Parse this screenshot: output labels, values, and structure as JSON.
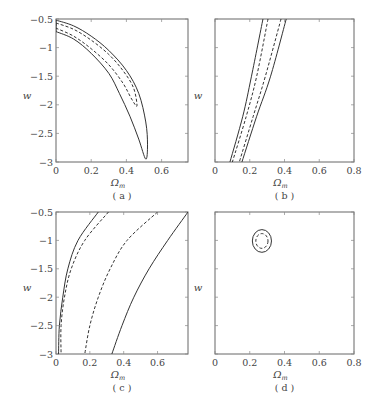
{
  "figure": {
    "panels": [
      {
        "id": "a",
        "caption": "( a )",
        "xlabel": "Ωm",
        "ylabel": "w",
        "xticks": [
          "0",
          "0.2",
          "0.4",
          "0.6"
        ],
        "yticks": [
          "-0.5",
          "-1",
          "-1.5",
          "-2",
          "-2.5",
          "-3"
        ],
        "show_yticks": true
      },
      {
        "id": "b",
        "caption": "( b )",
        "xlabel": "Ωm",
        "ylabel": "w",
        "xticks": [
          "0",
          "0.2",
          "0.4",
          "0.6",
          "0.8"
        ],
        "yticks": [],
        "show_yticks": false
      },
      {
        "id": "c",
        "caption": "( c )",
        "xlabel": "Ωm",
        "ylabel": "w",
        "xticks": [
          "0",
          "0.2",
          "0.4",
          "0.6"
        ],
        "yticks": [
          "-0.5",
          "-1",
          "-1.5",
          "-2",
          "-2.5",
          "-3"
        ],
        "show_yticks": true
      },
      {
        "id": "d",
        "caption": "( d )",
        "xlabel": "Ωm",
        "ylabel": "w",
        "xticks": [
          "0",
          "0.2",
          "0.4",
          "0.6",
          "0.8"
        ],
        "yticks": [],
        "show_yticks": false
      }
    ]
  },
  "chart_data": [
    {
      "type": "line",
      "title": "(a)",
      "xlabel": "Ωm",
      "ylabel": "w",
      "xlim": [
        0,
        0.75
      ],
      "ylim": [
        -3,
        -0.5
      ],
      "xticks": [
        0,
        0.2,
        0.4,
        0.6
      ],
      "yticks": [
        -0.5,
        -1,
        -1.5,
        -2,
        -2.5,
        -3
      ],
      "grid": false,
      "series": [
        {
          "name": "outer contour (solid)",
          "style": "solid",
          "points": [
            [
              0,
              -0.52
            ],
            [
              0.1,
              -0.62
            ],
            [
              0.2,
              -0.8
            ],
            [
              0.3,
              -1.05
            ],
            [
              0.4,
              -1.4
            ],
            [
              0.47,
              -1.8
            ],
            [
              0.51,
              -2.3
            ],
            [
              0.52,
              -2.7
            ],
            [
              0.51,
              -2.95
            ],
            [
              0.47,
              -2.6
            ],
            [
              0.42,
              -2.2
            ],
            [
              0.36,
              -1.8
            ],
            [
              0.3,
              -1.45
            ],
            [
              0.2,
              -1.1
            ],
            [
              0.1,
              -0.85
            ],
            [
              0,
              -0.72
            ]
          ]
        },
        {
          "name": "inner contour (dashed)",
          "style": "dashed",
          "points": [
            [
              0,
              -0.57
            ],
            [
              0.1,
              -0.68
            ],
            [
              0.2,
              -0.87
            ],
            [
              0.3,
              -1.12
            ],
            [
              0.38,
              -1.4
            ],
            [
              0.44,
              -1.7
            ],
            [
              0.46,
              -2.02
            ],
            [
              0.43,
              -1.9
            ],
            [
              0.38,
              -1.62
            ],
            [
              0.3,
              -1.3
            ],
            [
              0.2,
              -1.02
            ],
            [
              0.1,
              -0.8
            ],
            [
              0,
              -0.66
            ]
          ]
        }
      ]
    },
    {
      "type": "line",
      "title": "(b)",
      "xlabel": "Ωm",
      "ylabel": "w",
      "xlim": [
        0,
        0.8
      ],
      "ylim": [
        -3,
        -0.5
      ],
      "xticks": [
        0,
        0.2,
        0.4,
        0.6,
        0.8
      ],
      "grid": false,
      "series": [
        {
          "name": "outer contour left (solid)",
          "style": "solid",
          "points": [
            [
              0.276,
              -0.5
            ],
            [
              0.21,
              -1.5
            ],
            [
              0.16,
              -2.2
            ],
            [
              0.086,
              -3
            ]
          ]
        },
        {
          "name": "inner contour left (dashed)",
          "style": "dashed",
          "points": [
            [
              0.305,
              -0.5
            ],
            [
              0.24,
              -1.5
            ],
            [
              0.18,
              -2.2
            ],
            [
              0.1,
              -3
            ]
          ]
        },
        {
          "name": "inner contour right (dashed)",
          "style": "dashed",
          "points": [
            [
              0.38,
              -0.5
            ],
            [
              0.29,
              -1.5
            ],
            [
              0.22,
              -2.2
            ],
            [
              0.14,
              -3
            ]
          ]
        },
        {
          "name": "outer contour right (solid)",
          "style": "solid",
          "points": [
            [
              0.41,
              -0.5
            ],
            [
              0.32,
              -1.5
            ],
            [
              0.24,
              -2.2
            ],
            [
              0.155,
              -3
            ]
          ]
        }
      ]
    },
    {
      "type": "line",
      "title": "(c)",
      "xlabel": "Ωm",
      "ylabel": "w",
      "xlim": [
        0,
        0.78
      ],
      "ylim": [
        -3,
        -0.5
      ],
      "xticks": [
        0,
        0.2,
        0.4,
        0.6
      ],
      "yticks": [
        -0.5,
        -1,
        -1.5,
        -2,
        -2.5,
        -3
      ],
      "grid": false,
      "series": [
        {
          "name": "outer contour left (solid)",
          "style": "solid",
          "points": [
            [
              0.25,
              -0.5
            ],
            [
              0.13,
              -1.0
            ],
            [
              0.07,
              -1.5
            ],
            [
              0.04,
              -2.0
            ],
            [
              0.02,
              -2.5
            ],
            [
              0.015,
              -3
            ]
          ]
        },
        {
          "name": "inner contour left (dashed)",
          "style": "dashed",
          "points": [
            [
              0.31,
              -0.5
            ],
            [
              0.17,
              -1.0
            ],
            [
              0.09,
              -1.5
            ],
            [
              0.05,
              -2.0
            ],
            [
              0.03,
              -2.5
            ],
            [
              0.03,
              -3
            ]
          ]
        },
        {
          "name": "inner contour right (dashed)",
          "style": "dashed",
          "points": [
            [
              0.6,
              -0.5
            ],
            [
              0.42,
              -1.0
            ],
            [
              0.32,
              -1.5
            ],
            [
              0.25,
              -2.0
            ],
            [
              0.2,
              -2.5
            ],
            [
              0.17,
              -3
            ]
          ]
        },
        {
          "name": "outer contour right (solid)",
          "style": "solid",
          "points": [
            [
              0.78,
              -0.5
            ],
            [
              0.66,
              -1.0
            ],
            [
              0.55,
              -1.5
            ],
            [
              0.46,
              -2.0
            ],
            [
              0.39,
              -2.5
            ],
            [
              0.33,
              -3
            ]
          ]
        }
      ]
    },
    {
      "type": "line",
      "title": "(d)",
      "xlabel": "Ωm",
      "ylabel": "w",
      "xlim": [
        0,
        0.8
      ],
      "ylim": [
        -3,
        -0.5
      ],
      "xticks": [
        0,
        0.2,
        0.4,
        0.6,
        0.8
      ],
      "grid": false,
      "series": [
        {
          "name": "outer ellipse (solid)",
          "style": "solid",
          "center": [
            0.27,
            -1.01
          ],
          "radii": [
            0.055,
            0.2
          ]
        },
        {
          "name": "inner ellipse (dashed)",
          "style": "dashed",
          "center": [
            0.27,
            -1.01
          ],
          "radii": [
            0.035,
            0.13
          ]
        }
      ]
    }
  ]
}
